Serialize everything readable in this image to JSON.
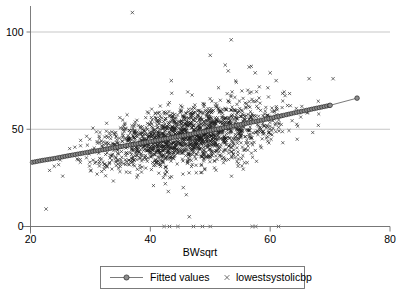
{
  "chart_data": {
    "type": "scatter",
    "title": "",
    "subtitle": "",
    "xlabel": "BWsqrt",
    "ylabel": "",
    "xlim": [
      20,
      80
    ],
    "ylim": [
      0,
      110
    ],
    "xticks": [
      20,
      40,
      60,
      80
    ],
    "xtick_labels": [
      "20",
      "40",
      "60",
      "80"
    ],
    "yticks": [
      0,
      50,
      100
    ],
    "ytick_labels": [
      "0",
      "50",
      "100"
    ],
    "grid": "horizontal-only",
    "gridlines_y": [
      0,
      50,
      100
    ],
    "legend_position": "below-plot",
    "legend": [
      {
        "name": "Fitted values",
        "marker": "circle",
        "style": "line-with-markers",
        "color": "#8d8d8d"
      },
      {
        "name": "lowestsystolicbp",
        "marker": "x",
        "style": "markers-only",
        "color": "#1a1a1a"
      }
    ],
    "series": [
      {
        "name": "lowestsystolicbp",
        "marker": "x",
        "description": "Dense scatter cloud of roughly 1800 points rising from about y=33 at x=20 to about y=60 at x=70, with a vertical spread of roughly +/-12 units, several high outliers near y=96-110 and a row of exact-zero values along the baseline.",
        "n_points_approx": 1800,
        "cloud_core": {
          "x_start": 20.5,
          "x_end": 72.0,
          "y_at_x_start": 33,
          "y_at_x_end": 60,
          "spread_sd": 7.5
        },
        "high_outliers": [
          {
            "x": 37.0,
            "y": 110
          },
          {
            "x": 53.5,
            "y": 96
          },
          {
            "x": 50.0,
            "y": 88
          },
          {
            "x": 52.5,
            "y": 83
          },
          {
            "x": 56.5,
            "y": 82
          },
          {
            "x": 53.0,
            "y": 80
          },
          {
            "x": 57.5,
            "y": 79
          },
          {
            "x": 60.0,
            "y": 79
          },
          {
            "x": 43.5,
            "y": 75
          },
          {
            "x": 66.5,
            "y": 76
          },
          {
            "x": 70.5,
            "y": 76
          },
          {
            "x": 61.0,
            "y": 75
          }
        ],
        "zero_points": [
          {
            "x": 42.3,
            "y": 0
          },
          {
            "x": 43.2,
            "y": 0
          },
          {
            "x": 44.6,
            "y": 0
          },
          {
            "x": 47.2,
            "y": 0
          },
          {
            "x": 48.7,
            "y": 0
          },
          {
            "x": 50.0,
            "y": 0
          },
          {
            "x": 57.0,
            "y": 0
          },
          {
            "x": 57.6,
            "y": 0
          },
          {
            "x": 61.4,
            "y": 0
          }
        ],
        "low_outliers": [
          {
            "x": 22.6,
            "y": 9
          },
          {
            "x": 46.5,
            "y": 5
          },
          {
            "x": 45.5,
            "y": 20
          },
          {
            "x": 43.0,
            "y": 18
          },
          {
            "x": 42.5,
            "y": 22
          }
        ]
      },
      {
        "name": "Fitted values",
        "marker": "circle",
        "style": "line-with-markers",
        "description": "Smooth increasing fit from about (20.3, 33) to (74.5, 66), nearly linear with a slight upward curve after x=60.",
        "points": [
          {
            "x": 20.3,
            "y": 33.0
          },
          {
            "x": 22.0,
            "y": 34.0
          },
          {
            "x": 24.0,
            "y": 35.0
          },
          {
            "x": 26.0,
            "y": 36.2
          },
          {
            "x": 28.0,
            "y": 37.3
          },
          {
            "x": 30.0,
            "y": 38.4
          },
          {
            "x": 32.0,
            "y": 39.4
          },
          {
            "x": 34.0,
            "y": 40.5
          },
          {
            "x": 36.0,
            "y": 41.6
          },
          {
            "x": 38.0,
            "y": 42.6
          },
          {
            "x": 40.0,
            "y": 43.7
          },
          {
            "x": 42.0,
            "y": 44.8
          },
          {
            "x": 44.0,
            "y": 45.9
          },
          {
            "x": 46.0,
            "y": 47.0
          },
          {
            "x": 48.0,
            "y": 48.2
          },
          {
            "x": 50.0,
            "y": 49.4
          },
          {
            "x": 52.0,
            "y": 50.6
          },
          {
            "x": 54.0,
            "y": 51.8
          },
          {
            "x": 56.0,
            "y": 53.0
          },
          {
            "x": 58.0,
            "y": 54.3
          },
          {
            "x": 60.0,
            "y": 55.6
          },
          {
            "x": 62.0,
            "y": 57.0
          },
          {
            "x": 64.0,
            "y": 58.4
          },
          {
            "x": 66.0,
            "y": 59.7
          },
          {
            "x": 68.0,
            "y": 61.0
          },
          {
            "x": 70.0,
            "y": 62.3
          },
          {
            "x": 74.5,
            "y": 66.0
          }
        ]
      }
    ]
  },
  "axes": {
    "x_title": "BWsqrt",
    "x_tick_labels": [
      "20",
      "40",
      "60",
      "80"
    ],
    "y_tick_labels": [
      "0",
      "50",
      "100"
    ]
  },
  "legend": {
    "fitted_label": "Fitted values",
    "scatter_label": "lowestsystolicbp"
  },
  "colors": {
    "grid": "#b9b9b9",
    "axis": "#6e6e6e",
    "scatter": "#1a1a1a",
    "fit_line": "#585858",
    "fit_marker_fill": "#8d8d8d",
    "background": "#ffffff"
  }
}
